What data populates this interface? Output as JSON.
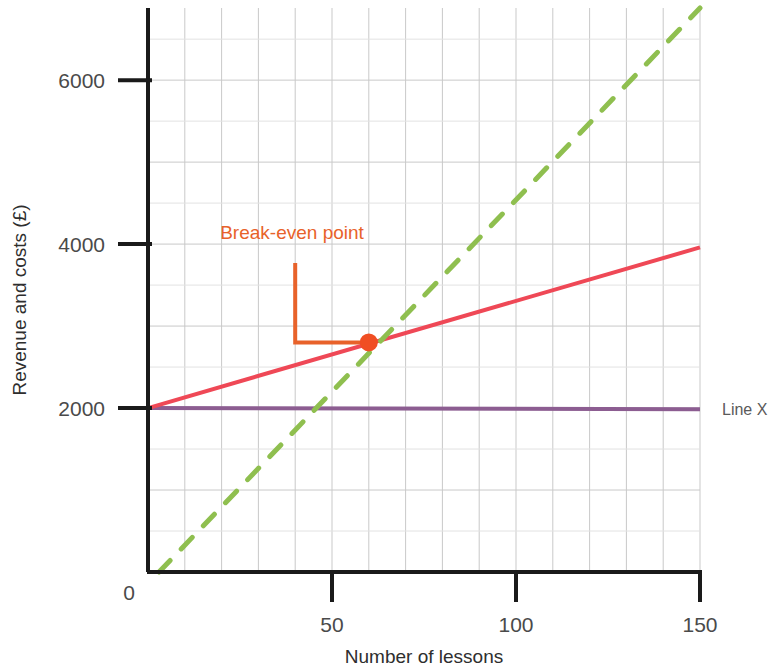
{
  "chart_data": {
    "type": "line",
    "title": "",
    "xlabel": "Number of lessons",
    "ylabel": "Revenue and costs (£)",
    "xlim": [
      0,
      150
    ],
    "ylim": [
      0,
      6880
    ],
    "grid": true,
    "grid_x_step": 10,
    "grid_y_step": 500,
    "xticks": [
      "0",
      "50",
      "100",
      "150"
    ],
    "xtick_values": [
      0,
      50,
      100,
      150
    ],
    "yticks": [
      "2000",
      "4000",
      "6000"
    ],
    "ytick_values": [
      2000,
      4000,
      6000
    ],
    "origin_label": "0",
    "legend_position": "right-inline",
    "series": [
      {
        "name": "Line X",
        "label": "Line X",
        "style": "solid",
        "color": "#8c5d91",
        "points": [
          [
            0,
            2000
          ],
          [
            150,
            1985
          ]
        ]
      },
      {
        "name": "Total costs",
        "label": "",
        "style": "solid",
        "color": "#ef4856",
        "points": [
          [
            0,
            2000
          ],
          [
            150,
            3960
          ]
        ]
      },
      {
        "name": "Revenue",
        "label": "",
        "style": "dashed",
        "color": "#8fbf4f",
        "points": [
          [
            3,
            0
          ],
          [
            150,
            6880
          ]
        ]
      }
    ],
    "annotations": [
      {
        "name": "break-even-point",
        "text": "Break-even point",
        "color": "#e8622a",
        "marker_color": "#f04e23",
        "point": [
          60,
          2800
        ],
        "text_x": 40,
        "text_y": 4000,
        "elbow_x": 40,
        "elbow_top_y": 3770,
        "elbow_bottom_y": 2800
      }
    ]
  },
  "colors": {
    "axis": "#1a1a1a",
    "grid": "#c9c9c9",
    "grid_minor": "#e2e2e2",
    "background": "#ffffff",
    "tick_text": "#4a4a4a",
    "accent_orange": "#e8622a",
    "line_red": "#ef4856",
    "line_purple": "#8c5d91",
    "line_green": "#8fbf4f"
  }
}
